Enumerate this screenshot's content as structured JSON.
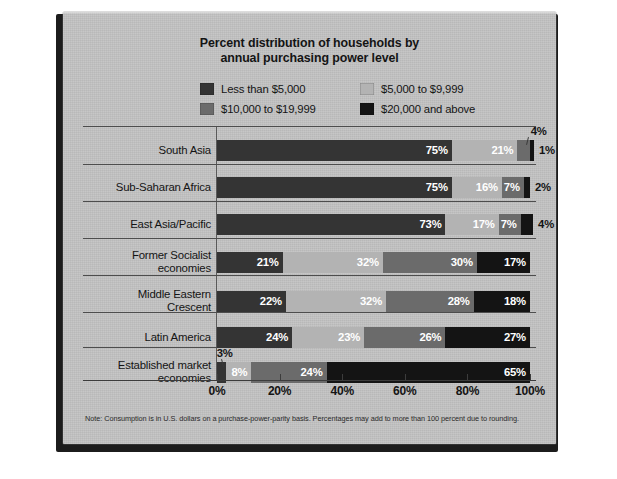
{
  "chart_data": {
    "type": "bar",
    "orientation": "horizontal",
    "stacked": true,
    "title": "Percent distribution of households by annual purchasing power level",
    "title_lines": [
      "Percent distribution of households by",
      "annual purchasing power level"
    ],
    "xlabel": "",
    "ylabel": "",
    "xlim": [
      0,
      100
    ],
    "grid": false,
    "legend_position": "top-center",
    "tick_labels": [
      "0%",
      "20%",
      "40%",
      "60%",
      "80%",
      "100%"
    ],
    "tick_values": [
      0,
      20,
      40,
      60,
      80,
      100
    ],
    "series": [
      {
        "name": "Less than $5,000",
        "color": "#343434",
        "values": [
          75,
          75,
          73,
          21,
          22,
          24,
          3
        ]
      },
      {
        "name": "$5,000 to $9,999",
        "color": "#b3b3b3",
        "values": [
          21,
          16,
          17,
          32,
          32,
          23,
          8
        ]
      },
      {
        "name": "$10,000 to $19,999",
        "color": "#6b6b6b",
        "values": [
          4,
          7,
          7,
          30,
          28,
          26,
          24
        ]
      },
      {
        "name": "$20,000 and above",
        "color": "#141414",
        "values": [
          1,
          2,
          4,
          17,
          18,
          27,
          65
        ]
      }
    ],
    "categories": [
      "South Asia",
      "Sub-Saharan Africa",
      "East Asia/Pacific",
      "Former Socialist economies",
      "Middle Eastern Crescent",
      "Latin America",
      "Established market economies"
    ],
    "note": "Note: Consumption is in U.S. dollars on a purchase-power-parity basis. Percentages may add to more than 100 percent due to rounding."
  },
  "legend": {
    "items": [
      {
        "label": "Less than $5,000",
        "color": "#343434"
      },
      {
        "label": "$5,000 to $9,999",
        "color": "#b3b3b3"
      },
      {
        "label": "$10,000 to $19,999",
        "color": "#6b6b6b"
      },
      {
        "label": "$20,000 and above",
        "color": "#141414"
      }
    ]
  },
  "rows": [
    {
      "label_lines": [
        "South Asia"
      ],
      "segments": [
        {
          "value": 75,
          "label": "75%",
          "color": "#343434",
          "label_inside": true,
          "show": true
        },
        {
          "value": 21,
          "label": "21%",
          "color": "#b3b3b3",
          "label_inside": true,
          "show": true
        },
        {
          "value": 4,
          "label": "4%",
          "color": "#6b6b6b",
          "label_inside": false,
          "show": false
        },
        {
          "value": 1,
          "label": "1%",
          "color": "#141414",
          "label_inside": false,
          "show": true
        }
      ],
      "callout": {
        "text": "4%",
        "segment_index": 2
      }
    },
    {
      "label_lines": [
        "Sub-Saharan Africa"
      ],
      "segments": [
        {
          "value": 75,
          "label": "75%",
          "color": "#343434",
          "label_inside": true,
          "show": true
        },
        {
          "value": 16,
          "label": "16%",
          "color": "#b3b3b3",
          "label_inside": true,
          "show": true
        },
        {
          "value": 7,
          "label": "7%",
          "color": "#6b6b6b",
          "label_inside": true,
          "show": true
        },
        {
          "value": 2,
          "label": "2%",
          "color": "#141414",
          "label_inside": false,
          "show": true
        }
      ],
      "callout": null
    },
    {
      "label_lines": [
        "East Asia/Pacific"
      ],
      "segments": [
        {
          "value": 73,
          "label": "73%",
          "color": "#343434",
          "label_inside": true,
          "show": true
        },
        {
          "value": 17,
          "label": "17%",
          "color": "#b3b3b3",
          "label_inside": true,
          "show": true
        },
        {
          "value": 7,
          "label": "7%",
          "color": "#6b6b6b",
          "label_inside": true,
          "show": true
        },
        {
          "value": 4,
          "label": "4%",
          "color": "#141414",
          "label_inside": false,
          "show": true
        }
      ],
      "callout": null
    },
    {
      "label_lines": [
        "Former Socialist",
        "economies"
      ],
      "segments": [
        {
          "value": 21,
          "label": "21%",
          "color": "#343434",
          "label_inside": true,
          "show": true
        },
        {
          "value": 32,
          "label": "32%",
          "color": "#b3b3b3",
          "label_inside": true,
          "show": true
        },
        {
          "value": 30,
          "label": "30%",
          "color": "#6b6b6b",
          "label_inside": true,
          "show": true
        },
        {
          "value": 17,
          "label": "17%",
          "color": "#141414",
          "label_inside": true,
          "show": true
        }
      ],
      "callout": null
    },
    {
      "label_lines": [
        "Middle Eastern",
        "Crescent"
      ],
      "segments": [
        {
          "value": 22,
          "label": "22%",
          "color": "#343434",
          "label_inside": true,
          "show": true
        },
        {
          "value": 32,
          "label": "32%",
          "color": "#b3b3b3",
          "label_inside": true,
          "show": true
        },
        {
          "value": 28,
          "label": "28%",
          "color": "#6b6b6b",
          "label_inside": true,
          "show": true
        },
        {
          "value": 18,
          "label": "18%",
          "color": "#141414",
          "label_inside": true,
          "show": true
        }
      ],
      "callout": null
    },
    {
      "label_lines": [
        "Latin America"
      ],
      "segments": [
        {
          "value": 24,
          "label": "24%",
          "color": "#343434",
          "label_inside": true,
          "show": true
        },
        {
          "value": 23,
          "label": "23%",
          "color": "#b3b3b3",
          "label_inside": true,
          "show": true
        },
        {
          "value": 26,
          "label": "26%",
          "color": "#6b6b6b",
          "label_inside": true,
          "show": true
        },
        {
          "value": 27,
          "label": "27%",
          "color": "#141414",
          "label_inside": true,
          "show": true
        }
      ],
      "callout": null
    },
    {
      "label_lines": [
        "Established market",
        "economies"
      ],
      "segments": [
        {
          "value": 3,
          "label": "3%",
          "color": "#343434",
          "label_inside": false,
          "show": false
        },
        {
          "value": 8,
          "label": "8%",
          "color": "#b3b3b3",
          "label_inside": true,
          "show": true
        },
        {
          "value": 24,
          "label": "24%",
          "color": "#6b6b6b",
          "label_inside": true,
          "show": true
        },
        {
          "value": 65,
          "label": "65%",
          "color": "#141414",
          "label_inside": true,
          "show": true
        }
      ],
      "callout": {
        "text": "3%",
        "segment_index": 0
      }
    }
  ],
  "axis": {
    "labels": [
      "0%",
      "20%",
      "40%",
      "60%",
      "80%",
      "100%"
    ],
    "values": [
      0,
      20,
      40,
      60,
      80,
      100
    ]
  },
  "note": {
    "text": "Note: Consumption is in U.S. dollars on a purchase-power-parity basis. Percentages may add to more than 100 percent due to rounding."
  }
}
